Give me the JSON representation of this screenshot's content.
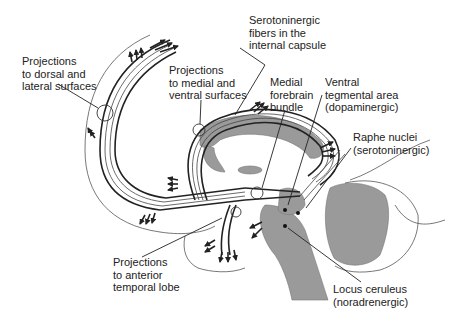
{
  "figure": {
    "colors": {
      "line": "#222222",
      "shaded_region": "#9a9a9a",
      "background": "#ffffff"
    }
  },
  "labels": {
    "serotonergic_capsule": "Serotoninergic\nfibers in the\ninternal capsule",
    "dorsal_lateral": "Projections\nto dorsal and\nlateral surfaces",
    "medial_ventral": "Projections\nto medial and\nventral surfaces",
    "medial_forebrain_bundle": "Medial\nforebrain\nbundle",
    "ventral_tegmental": "Ventral\ntegmental area\n(dopaminergic)",
    "raphe_nuclei": "Raphe nuclei\n(serotoninergic)",
    "anterior_temporal": "Projections\nto anterior\ntemporal lobe",
    "locus_ceruleus": "Locus ceruleus\n(noradrenergic)"
  },
  "structures": [
    "cerebral-outline",
    "corpus-callosum",
    "thalamus",
    "brainstem",
    "cerebellum",
    "temporal-lobe-outline"
  ]
}
